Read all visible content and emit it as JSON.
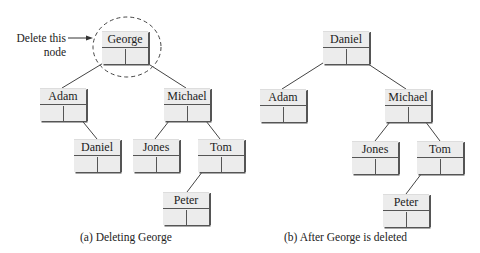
{
  "annotation": {
    "line1": "Delete this",
    "line2": "node"
  },
  "tree_a": {
    "caption": "(a) Deleting George",
    "nodes": {
      "george": "George",
      "adam": "Adam",
      "michael": "Michael",
      "daniel": "Daniel",
      "jones": "Jones",
      "tom": "Tom",
      "peter": "Peter"
    }
  },
  "tree_b": {
    "caption": "(b) After George is deleted",
    "nodes": {
      "daniel": "Daniel",
      "adam": "Adam",
      "michael": "Michael",
      "jones": "Jones",
      "tom": "Tom",
      "peter": "Peter"
    }
  },
  "colors": {
    "node_fill": "#ececec",
    "stroke": "#555555",
    "text": "#222222"
  }
}
